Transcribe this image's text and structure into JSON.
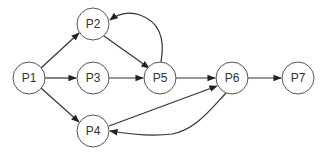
{
  "diagram": {
    "type": "directed-graph",
    "nodes": [
      {
        "id": "P1",
        "label": "P1",
        "x": 29,
        "y": 78
      },
      {
        "id": "P2",
        "label": "P2",
        "x": 93,
        "y": 24
      },
      {
        "id": "P3",
        "label": "P3",
        "x": 93,
        "y": 78
      },
      {
        "id": "P4",
        "label": "P4",
        "x": 93,
        "y": 131
      },
      {
        "id": "P5",
        "label": "P5",
        "x": 160,
        "y": 78
      },
      {
        "id": "P6",
        "label": "P6",
        "x": 232,
        "y": 78
      },
      {
        "id": "P7",
        "label": "P7",
        "x": 298,
        "y": 78
      }
    ],
    "edges": [
      {
        "from": "P1",
        "to": "P2",
        "style": "straight"
      },
      {
        "from": "P1",
        "to": "P3",
        "style": "straight"
      },
      {
        "from": "P1",
        "to": "P4",
        "style": "straight"
      },
      {
        "from": "P2",
        "to": "P5",
        "style": "straight"
      },
      {
        "from": "P3",
        "to": "P5",
        "style": "straight"
      },
      {
        "from": "P5",
        "to": "P2",
        "style": "curved"
      },
      {
        "from": "P5",
        "to": "P6",
        "style": "straight"
      },
      {
        "from": "P4",
        "to": "P6",
        "style": "straight"
      },
      {
        "from": "P6",
        "to": "P4",
        "style": "curved"
      },
      {
        "from": "P6",
        "to": "P7",
        "style": "straight"
      }
    ],
    "colors": {
      "node_stroke": "#555555",
      "node_fill": "#ffffff",
      "edge": "#333333",
      "text": "#333333"
    }
  }
}
